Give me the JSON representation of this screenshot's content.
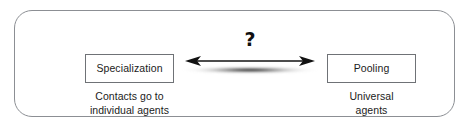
{
  "diagram": {
    "frame": {
      "shape": "rounded-rectangle",
      "border_color": "#8c8f94",
      "background_color": "#ffffff"
    },
    "left_node": {
      "box_label": "Specialization",
      "caption_line_1": "Contacts go to",
      "caption_line_2": "individual agents",
      "border_color": "#6f7276",
      "text_color": "#1b1b1b"
    },
    "right_node": {
      "box_label": "Pooling",
      "caption_line_1": "Universal",
      "caption_line_2": "agents",
      "border_color": "#6f7276",
      "text_color": "#1b1b1b"
    },
    "connector": {
      "type": "double-headed-arrow",
      "annotation": "?",
      "annotation_color": "#101010",
      "line_color": "#111111",
      "has_drop_shadow": true
    }
  }
}
